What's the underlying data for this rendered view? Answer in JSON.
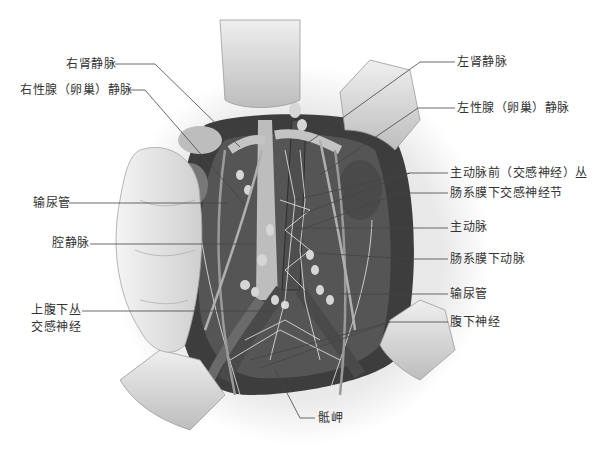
{
  "figure": {
    "colors": {
      "background": "#ffffff",
      "cavity_dark": "#3a3a3a",
      "vessel_light": "#c9c9c9",
      "retractor": "#d8d8d8",
      "leader_line": "#444444",
      "label_text": "#333333"
    },
    "labels_left": {
      "right_renal_vein": "右肾静脉",
      "right_gonadal_vein": "右性腺（卵巢）静脉",
      "ureter_left": "输尿管",
      "vena_cava": "腔静脉",
      "superior_hypogastric_line1": "上腹下丛",
      "superior_hypogastric_line2": "交感神经"
    },
    "labels_right": {
      "left_renal_vein": "左肾静脉",
      "left_gonadal_vein": "左性腺（卵巢）静脉",
      "preaortic_plexus": "主动脉前（交感神经）丛",
      "inferior_mesenteric_ganglion": "肠系膜下交感神经节",
      "aorta": "主动脉",
      "inferior_mesenteric_artery": "肠系膜下动脉",
      "ureter_right": "输尿管",
      "hypogastric_nerve": "腹下神经"
    },
    "labels_bottom": {
      "sacral_promontory": "骶岬"
    }
  }
}
